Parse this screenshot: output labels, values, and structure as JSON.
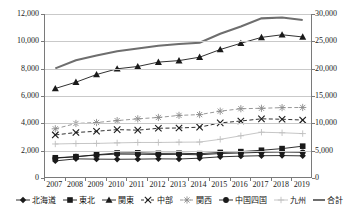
{
  "chart_data": {
    "type": "line",
    "title": "",
    "xlabel": "",
    "ylabel": "",
    "y2label": "",
    "grid": true,
    "legend_position": "bottom",
    "categories": [
      "2007",
      "2008",
      "2009",
      "2010",
      "2011",
      "2012",
      "2013",
      "2014",
      "2015",
      "2016",
      "2017",
      "2018",
      "2019"
    ],
    "ylim": [
      0,
      12000
    ],
    "yticks": [
      "0",
      "2,000",
      "4,000",
      "6,000",
      "8,000",
      "10,000",
      "12,000"
    ],
    "y2lim": [
      0,
      30000
    ],
    "y2ticks": [
      "0",
      "5,000",
      "10,000",
      "15,000",
      "20,000",
      "25,000",
      "30,000"
    ],
    "series": [
      {
        "name": "北海道",
        "axis": "left",
        "marker": "diamond",
        "line": "solid",
        "color": "#1a1a1a",
        "values": [
          1250,
          1400,
          1380,
          1370,
          1380,
          1400,
          1390,
          1450,
          1550,
          1600,
          1630,
          1640,
          1620
        ]
      },
      {
        "name": "東北",
        "axis": "left",
        "marker": "square",
        "line": "solid",
        "color": "#1a1a1a",
        "values": [
          1480,
          1560,
          1700,
          1830,
          1840,
          1800,
          1810,
          1780,
          1870,
          1930,
          2030,
          2150,
          2330
        ]
      },
      {
        "name": "関東",
        "axis": "left",
        "marker": "triangle",
        "line": "solid",
        "color": "#1a1a1a",
        "values": [
          6550,
          7010,
          7570,
          7990,
          8160,
          8480,
          8590,
          8840,
          9400,
          9860,
          10290,
          10480,
          10320
        ]
      },
      {
        "name": "中部",
        "axis": "left",
        "marker": "x",
        "line": "dashed",
        "color": "#1a1a1a",
        "values": [
          3150,
          3330,
          3420,
          3540,
          3500,
          3640,
          3660,
          3720,
          4030,
          4170,
          4330,
          4300,
          4240
        ]
      },
      {
        "name": "関西",
        "axis": "left",
        "marker": "asterisk",
        "line": "dashed",
        "color": "#8c8c8c",
        "values": [
          3600,
          3990,
          4060,
          4200,
          4330,
          4430,
          4580,
          4640,
          4890,
          5070,
          5100,
          5150,
          5160
        ]
      },
      {
        "name": "中国四国",
        "axis": "left",
        "marker": "circle",
        "line": "solid",
        "color": "#1a1a1a",
        "values": [
          1450,
          1560,
          1680,
          1750,
          1740,
          1720,
          1730,
          1700,
          1790,
          1830,
          1880,
          1900,
          1880
        ]
      },
      {
        "name": "九州",
        "axis": "left",
        "marker": "plus",
        "line": "solid",
        "color": "#c0c0c0",
        "values": [
          2490,
          2520,
          2530,
          2570,
          2600,
          2600,
          2620,
          2630,
          2830,
          3090,
          3350,
          3310,
          3250
        ]
      },
      {
        "name": "合計",
        "axis": "right",
        "marker": "none",
        "line": "solid",
        "color": "#6e6e6e",
        "values": [
          20050,
          21550,
          22400,
          23200,
          23700,
          24200,
          24500,
          24750,
          26400,
          27700,
          29200,
          29350,
          28900
        ]
      }
    ]
  },
  "legend": {
    "items": [
      {
        "label": "北海道",
        "marker": "diamond"
      },
      {
        "label": "東北",
        "marker": "square"
      },
      {
        "label": "関東",
        "marker": "triangle"
      },
      {
        "label": "中部",
        "marker": "x"
      },
      {
        "label": "関西",
        "marker": "asterisk"
      },
      {
        "label": "中国四国",
        "marker": "circle"
      },
      {
        "label": "九州",
        "marker": "plus"
      },
      {
        "label": "合計",
        "marker": "none"
      }
    ]
  }
}
